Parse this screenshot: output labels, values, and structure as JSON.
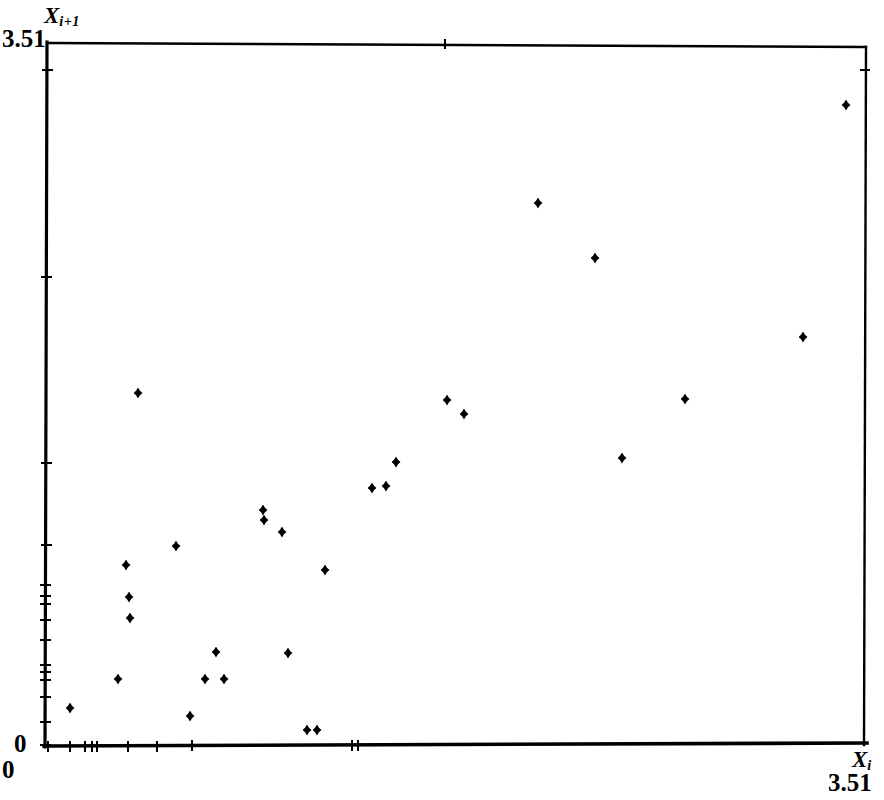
{
  "figure": {
    "type": "scatter-plot",
    "background": "#ffffff",
    "foreground": "#000000",
    "width": 884,
    "height": 800
  },
  "labels": {
    "y_axis_symbol": "X",
    "y_axis_subscript": "i+1",
    "x_axis_symbol": "X",
    "x_axis_subscript": "i",
    "y_max": "3.51",
    "y_min": "0",
    "x_min": "0",
    "x_max": "3.51"
  },
  "chart_data": {
    "type": "scatter",
    "title": "",
    "xlabel": "X_i",
    "ylabel": "X_{i+1}",
    "xlim": [
      0,
      3.51
    ],
    "ylim": [
      0,
      3.51
    ],
    "grid": false,
    "legend": false,
    "marker": "diamond",
    "marker_color": "#000000",
    "xticks_values": [
      0.0,
      0.09,
      0.16,
      0.19,
      0.21,
      0.35,
      0.48,
      0.63,
      1.34,
      1.37,
      3.51
    ],
    "yticks_values": [
      0.0,
      0.02,
      0.05,
      0.08,
      0.11,
      0.17,
      0.21,
      0.24,
      0.3,
      0.33,
      0.43,
      0.5,
      0.74,
      1.32,
      2.24,
      3.23,
      3.51
    ],
    "points": [
      {
        "x": 0.09,
        "y": 0.22
      },
      {
        "x": 0.3,
        "y": 0.27
      },
      {
        "x": 0.35,
        "y": 0.79
      },
      {
        "x": 0.36,
        "y": 0.59
      },
      {
        "x": 0.37,
        "y": 0.53
      },
      {
        "x": 0.39,
        "y": 1.32
      },
      {
        "x": 0.52,
        "y": 0.92
      },
      {
        "x": 0.57,
        "y": 0.09
      },
      {
        "x": 0.62,
        "y": 0.28
      },
      {
        "x": 0.7,
        "y": 0.26
      },
      {
        "x": 0.73,
        "y": 0.37
      },
      {
        "x": 0.89,
        "y": 1.02
      },
      {
        "x": 0.9,
        "y": 0.98
      },
      {
        "x": 0.95,
        "y": 0.91
      },
      {
        "x": 1.05,
        "y": 0.35
      },
      {
        "x": 1.15,
        "y": 0.26
      },
      {
        "x": 1.17,
        "y": 0.06
      },
      {
        "x": 1.26,
        "y": 0.06
      },
      {
        "x": 1.22,
        "y": 0.76
      },
      {
        "x": 1.41,
        "y": 1.09
      },
      {
        "x": 1.45,
        "y": 1.05
      },
      {
        "x": 1.52,
        "y": 1.31
      },
      {
        "x": 1.56,
        "y": 1.26
      },
      {
        "x": 1.69,
        "y": 1.47
      },
      {
        "x": 1.74,
        "y": 1.45
      },
      {
        "x": 2.0,
        "y": 2.24
      },
      {
        "x": 2.25,
        "y": 1.98
      },
      {
        "x": 2.36,
        "y": 1.14
      },
      {
        "x": 2.36,
        "y": 0.35
      },
      {
        "x": 2.62,
        "y": 1.43
      },
      {
        "x": 2.78,
        "y": 1.63
      },
      {
        "x": 3.26,
        "y": 3.23
      },
      {
        "x": 3.43,
        "y": 3.41
      }
    ]
  },
  "geometry": {
    "plot_left_px": 47,
    "plot_right_px": 866,
    "plot_top_px": 43,
    "plot_bottom_px": 746,
    "points_px": [
      {
        "cx": 70,
        "cy": 708
      },
      {
        "cx": 118,
        "cy": 679
      },
      {
        "cx": 126,
        "cy": 565
      },
      {
        "cx": 129,
        "cy": 597
      },
      {
        "cx": 130,
        "cy": 618
      },
      {
        "cx": 138,
        "cy": 393
      },
      {
        "cx": 176,
        "cy": 546
      },
      {
        "cx": 190,
        "cy": 716
      },
      {
        "cx": 205,
        "cy": 679
      },
      {
        "cx": 216,
        "cy": 652
      },
      {
        "cx": 224,
        "cy": 679
      },
      {
        "cx": 263,
        "cy": 510
      },
      {
        "cx": 264,
        "cy": 520
      },
      {
        "cx": 282,
        "cy": 532
      },
      {
        "cx": 288,
        "cy": 653
      },
      {
        "cx": 307,
        "cy": 730
      },
      {
        "cx": 317,
        "cy": 730
      },
      {
        "cx": 325,
        "cy": 570
      },
      {
        "cx": 372,
        "cy": 488
      },
      {
        "cx": 386,
        "cy": 486
      },
      {
        "cx": 396,
        "cy": 462
      },
      {
        "cx": 447,
        "cy": 400
      },
      {
        "cx": 464,
        "cy": 414
      },
      {
        "cx": 538,
        "cy": 203
      },
      {
        "cx": 595,
        "cy": 258
      },
      {
        "cx": 622,
        "cy": 458
      },
      {
        "cx": 685,
        "cy": 399
      },
      {
        "cx": 803,
        "cy": 337
      },
      {
        "cx": 846,
        "cy": 105
      }
    ],
    "xticks_px": [
      48,
      70,
      85,
      92,
      97,
      128,
      157,
      192,
      352,
      358
    ],
    "yticks_px": [
      70,
      277,
      463,
      545,
      585,
      596,
      604,
      620,
      640,
      665,
      672,
      680,
      697,
      722,
      745
    ],
    "top_tick_px": 445,
    "right_tick_py": 70
  }
}
